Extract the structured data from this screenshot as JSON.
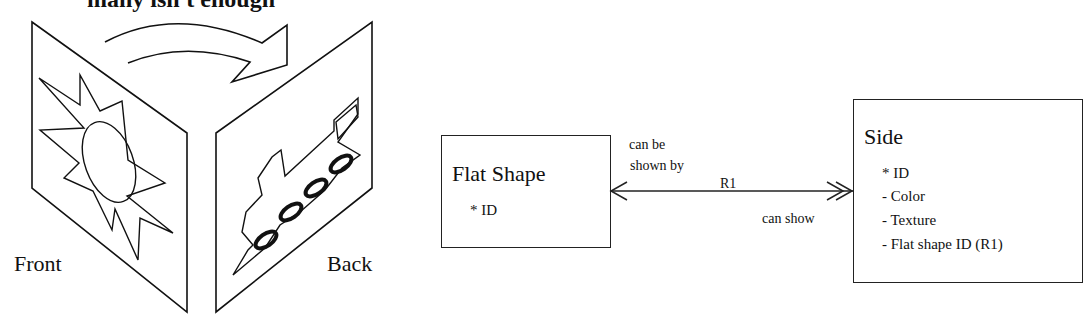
{
  "heading": "many isn't enough",
  "illustration": {
    "front_label": "Front",
    "back_label": "Back"
  },
  "diagram": {
    "entity_left": {
      "name": "Flat Shape",
      "attributes": [
        "* ID"
      ]
    },
    "relationship": {
      "id": "R1",
      "left_phrase_line1": "can be",
      "left_phrase_line2": "shown by",
      "right_phrase": "can show"
    },
    "entity_right": {
      "name": "Side",
      "attributes": [
        "* ID",
        "- Color",
        "- Texture",
        "- Flat shape ID (R1)"
      ]
    }
  }
}
